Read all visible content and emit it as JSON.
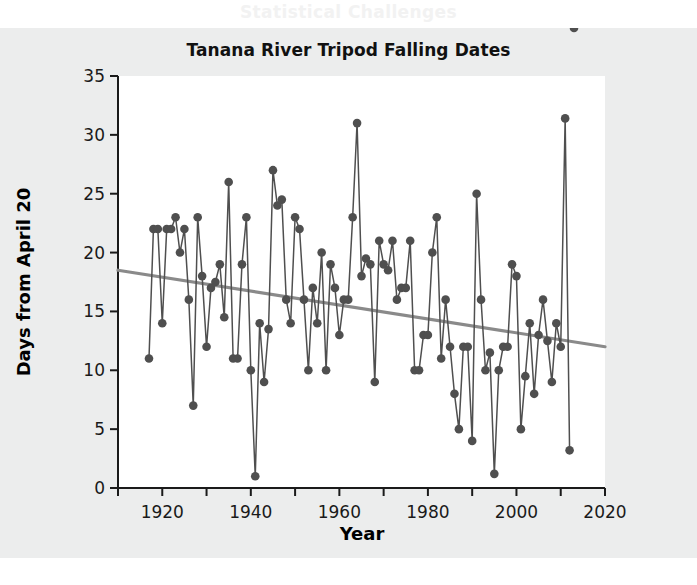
{
  "page": {
    "background_color": "#ffffff",
    "figure_tint_color": "#eceded",
    "bleed_through_text": "Statistical Challenges"
  },
  "chart_data": {
    "type": "line",
    "title": "Tanana River Tripod Falling Dates",
    "xlabel": "Year",
    "ylabel": "Days from April 20",
    "xlim": [
      1910,
      2020
    ],
    "ylim": [
      0,
      35
    ],
    "xticks": [
      1910,
      1920,
      1930,
      1940,
      1950,
      1960,
      1970,
      1980,
      1990,
      2000,
      2010,
      2020
    ],
    "xticklabels": [
      "",
      "1920",
      "",
      "1940",
      "",
      "1960",
      "",
      "1980",
      "",
      "2000",
      "",
      "2020"
    ],
    "yticks": [
      0,
      5,
      10,
      15,
      20,
      25,
      30,
      35
    ],
    "yticklabels": [
      "0",
      "5",
      "10",
      "15",
      "20",
      "25",
      "30",
      "35"
    ],
    "grid": false,
    "legend": false,
    "marker": "filled-circle",
    "series_color": "#4f4f4f",
    "trend_color": "#8a8a8a",
    "x": [
      1917,
      1918,
      1919,
      1920,
      1921,
      1922,
      1923,
      1924,
      1925,
      1926,
      1927,
      1928,
      1929,
      1930,
      1931,
      1932,
      1933,
      1934,
      1935,
      1936,
      1937,
      1938,
      1939,
      1940,
      1941,
      1942,
      1943,
      1944,
      1945,
      1946,
      1947,
      1948,
      1949,
      1950,
      1951,
      1952,
      1953,
      1954,
      1955,
      1956,
      1957,
      1958,
      1959,
      1960,
      1961,
      1962,
      1963,
      1964,
      1965,
      1966,
      1967,
      1968,
      1969,
      1970,
      1971,
      1972,
      1973,
      1974,
      1975,
      1976,
      1977,
      1978,
      1979,
      1980,
      1981,
      1982,
      1983,
      1984,
      1985,
      1986,
      1987,
      1988,
      1989,
      1990,
      1991,
      1992,
      1993,
      1994,
      1995,
      1996,
      1997,
      1998,
      1999,
      2000,
      2001,
      2002,
      2003,
      2004,
      2005,
      2006,
      2007,
      2008,
      2009,
      2010,
      2011,
      2012,
      2013
    ],
    "y": [
      11,
      22,
      22,
      14,
      22,
      22,
      23,
      20,
      22,
      16,
      7,
      23,
      18,
      12,
      17,
      17.5,
      19,
      14.5,
      26,
      11,
      11,
      19,
      23,
      10,
      1,
      14,
      9,
      13.5,
      27,
      24,
      24.5,
      16,
      14,
      23,
      22,
      16,
      10,
      17,
      14,
      20,
      10,
      19,
      17,
      13,
      16,
      16,
      23,
      31,
      18,
      19.5,
      19,
      9,
      21,
      19,
      18.5,
      21,
      16,
      17,
      17,
      21,
      10,
      10,
      13,
      13,
      20,
      23,
      11,
      16,
      12,
      8,
      5,
      12,
      12,
      4,
      25,
      16,
      10,
      11.5,
      1.2,
      10,
      12,
      12,
      19,
      18,
      5,
      9.5,
      14,
      8,
      13,
      16,
      12.5,
      9,
      14,
      12,
      31.4,
      3.2
    ],
    "trend_line": {
      "x": [
        1910,
        2020
      ],
      "y": [
        18.5,
        12.0
      ]
    }
  }
}
